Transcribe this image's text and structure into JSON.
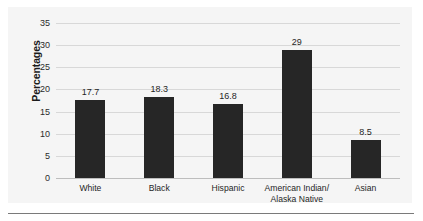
{
  "chart_data": {
    "type": "bar",
    "title": "",
    "xlabel": "",
    "ylabel": "Percentages",
    "categories": [
      "White",
      "Black",
      "Hispanic",
      "American Indian/\nAlaska Native",
      "Asian"
    ],
    "values": [
      17.7,
      18.3,
      16.8,
      29,
      8.5
    ],
    "value_labels": [
      "17.7",
      "18.3",
      "16.8",
      "29",
      "8.5"
    ],
    "ylim": [
      0,
      35
    ],
    "ytick_labels": [
      "0",
      "5",
      "10",
      "15",
      "20",
      "25",
      "30",
      "35"
    ],
    "ytick_values": [
      0,
      5,
      10,
      15,
      20,
      25,
      30,
      35
    ],
    "grid": true,
    "legend": false,
    "bar_color": "#262626",
    "gridline_color": "#d8d8d8",
    "panel_color": "#f5f5f5",
    "text_color": "#1f1f1f"
  }
}
